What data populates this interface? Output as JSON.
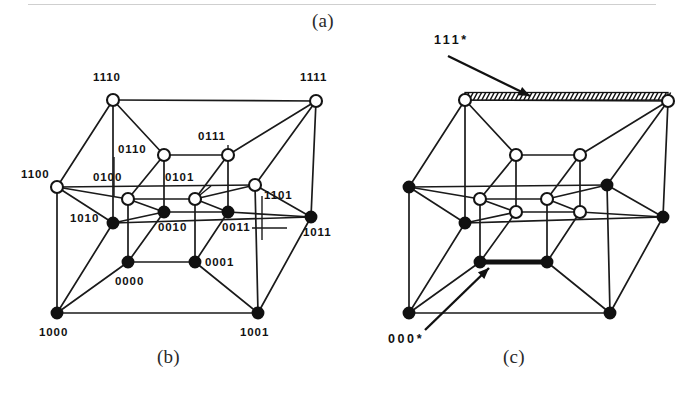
{
  "figure": {
    "panels": [
      {
        "id": "a",
        "caption": "(a)"
      },
      {
        "id": "b",
        "caption": "(b)"
      },
      {
        "id": "c",
        "caption": "(c)"
      }
    ]
  },
  "chart_data": {
    "type": "diagram",
    "title": "",
    "subtitle": "",
    "panel_b": {
      "caption": "(b)",
      "nodes": [
        {
          "label": "1110",
          "x": 113,
          "y": 100,
          "state": "open",
          "label_x": 93,
          "label_y": 81
        },
        {
          "label": "1111",
          "x": 316,
          "y": 101,
          "state": "open",
          "label_x": 300,
          "label_y": 81
        },
        {
          "label": "1100",
          "x": 57,
          "y": 187,
          "state": "open",
          "label_x": 21,
          "label_y": 178
        },
        {
          "label": "1101",
          "x": 255,
          "y": 185,
          "state": "open",
          "label_x": 264,
          "label_y": 199
        },
        {
          "label": "1000",
          "x": 57,
          "y": 313,
          "state": "filled",
          "label_x": 39,
          "label_y": 336
        },
        {
          "label": "1001",
          "x": 258,
          "y": 313,
          "state": "filled",
          "label_x": 240,
          "label_y": 336
        },
        {
          "label": "1010",
          "x": 113,
          "y": 223,
          "state": "filled",
          "label_x": 70,
          "label_y": 222
        },
        {
          "label": "1011",
          "x": 311,
          "y": 217,
          "state": "filled",
          "label_x": 303,
          "label_y": 236
        },
        {
          "label": "0110",
          "x": 164,
          "y": 155,
          "state": "open",
          "label_x": 118,
          "label_y": 153
        },
        {
          "label": "0111",
          "x": 228,
          "y": 155,
          "state": "open",
          "label_x": 198,
          "label_y": 140
        },
        {
          "label": "0100",
          "x": 128,
          "y": 199,
          "state": "open",
          "label_x": 93,
          "label_y": 181
        },
        {
          "label": "0101",
          "x": 195,
          "y": 199,
          "state": "open",
          "label_x": 165,
          "label_y": 181
        },
        {
          "label": "0010",
          "x": 164,
          "y": 212,
          "state": "filled",
          "label_x": 158,
          "label_y": 231
        },
        {
          "label": "0011",
          "x": 228,
          "y": 212,
          "state": "filled",
          "label_x": 222,
          "label_y": 231
        },
        {
          "label": "0000",
          "x": 128,
          "y": 262,
          "state": "filled",
          "label_x": 115,
          "label_y": 285
        },
        {
          "label": "0001",
          "x": 195,
          "y": 262,
          "state": "filled",
          "label_x": 205,
          "label_y": 266
        }
      ],
      "leaders": [
        {
          "from": "0110-label",
          "x1": 114,
          "y1": 157,
          "x2": 114,
          "y2": 196
        },
        {
          "from": "0111-label",
          "x1": 228,
          "y1": 145,
          "x2": 228,
          "y2": 155
        },
        {
          "from": "0101-label",
          "x1": 211,
          "y1": 186,
          "x2": 195,
          "y2": 199
        },
        {
          "from": "0011-label",
          "x1": 252,
          "y1": 228,
          "x2": 287,
          "y2": 228
        },
        {
          "from": "1101-label",
          "x1": 262,
          "y1": 196,
          "x2": 262,
          "y2": 240
        }
      ]
    },
    "panel_c": {
      "caption": "(c)",
      "callouts": [
        {
          "text": "111*",
          "marker": "hatched-edge",
          "label_x": 82,
          "label_y": 44,
          "arrow_from_x": 96,
          "arrow_from_y": 56,
          "arrow_to_x": 178,
          "arrow_to_y": 96
        },
        {
          "text": "000*",
          "marker": "bold-edge",
          "label_x": 36,
          "label_y": 343,
          "arrow_from_x": 73,
          "arrow_from_y": 330,
          "arrow_to_x": 137,
          "arrow_to_y": 268
        }
      ],
      "nodes": [
        {
          "ref": "1110",
          "x": 113,
          "y": 100,
          "state": "open"
        },
        {
          "ref": "1111",
          "x": 316,
          "y": 101,
          "state": "open"
        },
        {
          "ref": "1100",
          "x": 57,
          "y": 187,
          "state": "filled"
        },
        {
          "ref": "1101",
          "x": 255,
          "y": 185,
          "state": "filled"
        },
        {
          "ref": "1000",
          "x": 57,
          "y": 313,
          "state": "filled"
        },
        {
          "ref": "1001",
          "x": 258,
          "y": 313,
          "state": "filled"
        },
        {
          "ref": "1010",
          "x": 113,
          "y": 223,
          "state": "filled"
        },
        {
          "ref": "1011",
          "x": 311,
          "y": 217,
          "state": "filled"
        },
        {
          "ref": "0110",
          "x": 164,
          "y": 155,
          "state": "open"
        },
        {
          "ref": "0111",
          "x": 228,
          "y": 155,
          "state": "open"
        },
        {
          "ref": "0100",
          "x": 128,
          "y": 199,
          "state": "open"
        },
        {
          "ref": "0101",
          "x": 195,
          "y": 199,
          "state": "open"
        },
        {
          "ref": "0010",
          "x": 164,
          "y": 212,
          "state": "open"
        },
        {
          "ref": "0011",
          "x": 228,
          "y": 212,
          "state": "open"
        },
        {
          "ref": "0000",
          "x": 128,
          "y": 262,
          "state": "filled"
        },
        {
          "ref": "0001",
          "x": 195,
          "y": 262,
          "state": "filled"
        }
      ],
      "hatched_edge": {
        "x1": 113,
        "y1": 100,
        "x2": 316,
        "y2": 101
      },
      "bold_edge": {
        "x1": 128,
        "y1": 262,
        "x2": 195,
        "y2": 262
      }
    },
    "edges": [
      [
        "1110",
        "1111"
      ],
      [
        "1110",
        "1100"
      ],
      [
        "1111",
        "1101"
      ],
      [
        "1100",
        "1101"
      ],
      [
        "1000",
        "1001"
      ],
      [
        "1000",
        "1100"
      ],
      [
        "1001",
        "1101"
      ],
      [
        "1010",
        "1011"
      ],
      [
        "1110",
        "1010"
      ],
      [
        "1111",
        "1011"
      ],
      [
        "1010",
        "1000"
      ],
      [
        "1011",
        "1001"
      ],
      [
        "1100",
        "1010"
      ],
      [
        "1101",
        "1011"
      ],
      [
        "0110",
        "0111"
      ],
      [
        "0110",
        "0100"
      ],
      [
        "0111",
        "0101"
      ],
      [
        "0100",
        "0101"
      ],
      [
        "0000",
        "0001"
      ],
      [
        "0000",
        "0100"
      ],
      [
        "0001",
        "0101"
      ],
      [
        "0010",
        "0011"
      ],
      [
        "0110",
        "0010"
      ],
      [
        "0111",
        "0011"
      ],
      [
        "0010",
        "0000"
      ],
      [
        "0011",
        "0001"
      ],
      [
        "0100",
        "0010"
      ],
      [
        "0101",
        "0011"
      ],
      [
        "1110",
        "0110"
      ],
      [
        "1111",
        "0111"
      ],
      [
        "1100",
        "0100"
      ],
      [
        "1101",
        "0101"
      ],
      [
        "1010",
        "0010"
      ],
      [
        "1011",
        "0011"
      ],
      [
        "1000",
        "0000"
      ],
      [
        "1001",
        "0001"
      ]
    ]
  }
}
